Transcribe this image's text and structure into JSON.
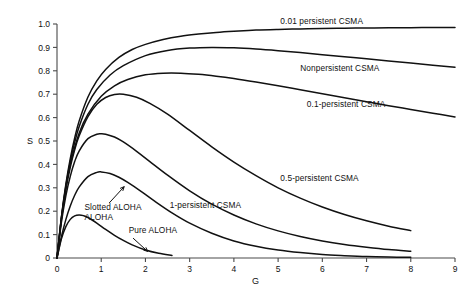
{
  "chart_data": {
    "type": "line",
    "title": "",
    "xlabel": "G",
    "ylabel": "S",
    "xlim": [
      0,
      9
    ],
    "ylim": [
      0,
      1.0
    ],
    "grid": false,
    "legend_position": "inline-annotations",
    "xticks": [
      "0",
      "1",
      "2",
      "3",
      "4",
      "5",
      "6",
      "7",
      "8",
      "9"
    ],
    "yticks": [
      "0",
      "0.1",
      "0.2",
      "0.3",
      "0.4",
      "0.5",
      "0.6",
      "0.7",
      "0.8",
      "0.9",
      "1.0"
    ],
    "series": [
      {
        "name": "0.01 persistent CSMA",
        "label": "0.01 persistent CSMA",
        "label_x": 5.05,
        "label_y": 1.0,
        "peak_value": 0.985,
        "x": [
          0,
          0.1,
          0.2,
          0.3,
          0.4,
          0.5,
          0.7,
          0.9,
          1.1,
          1.4,
          1.7,
          2.0,
          2.4,
          2.8,
          3.2,
          3.6,
          4.0,
          4.5,
          5.0,
          5.5,
          6.0,
          6.5,
          7.0,
          7.5,
          8.0,
          8.5,
          9.0
        ],
        "y": [
          0,
          0.175,
          0.315,
          0.425,
          0.513,
          0.585,
          0.688,
          0.757,
          0.806,
          0.857,
          0.891,
          0.913,
          0.934,
          0.948,
          0.957,
          0.964,
          0.969,
          0.974,
          0.977,
          0.979,
          0.981,
          0.982,
          0.983,
          0.984,
          0.984,
          0.985,
          0.985
        ]
      },
      {
        "name": "Nonpersistent CSMA",
        "label": "Nonpersistent CSMA",
        "label_x": 5.5,
        "label_y": 0.8,
        "peak_value": 0.9,
        "x": [
          0,
          0.1,
          0.2,
          0.3,
          0.4,
          0.5,
          0.7,
          0.9,
          1.2,
          1.5,
          2.0,
          2.5,
          3.0,
          3.5,
          4.0,
          4.5,
          5.0,
          5.5,
          6.0,
          6.5,
          7.0,
          7.5,
          8.0,
          8.5,
          9.0
        ],
        "y": [
          0,
          0.173,
          0.307,
          0.412,
          0.494,
          0.561,
          0.657,
          0.72,
          0.782,
          0.822,
          0.865,
          0.887,
          0.897,
          0.9,
          0.898,
          0.893,
          0.886,
          0.878,
          0.869,
          0.86,
          0.851,
          0.842,
          0.833,
          0.824,
          0.815
        ]
      },
      {
        "name": "0.1-persistent CSMA",
        "label": "0.1-persistent CSMA",
        "label_x": 5.65,
        "label_y": 0.645,
        "peak_value": 0.79,
        "x": [
          0,
          0.1,
          0.2,
          0.3,
          0.5,
          0.7,
          1.0,
          1.3,
          1.6,
          2.0,
          2.4,
          2.8,
          3.2,
          3.6,
          4.0,
          4.5,
          5.0,
          5.5,
          6.0,
          6.5,
          7.0,
          7.5,
          8.0,
          8.5,
          9.0
        ],
        "y": [
          0,
          0.17,
          0.3,
          0.4,
          0.533,
          0.615,
          0.691,
          0.736,
          0.763,
          0.783,
          0.79,
          0.79,
          0.785,
          0.777,
          0.767,
          0.752,
          0.736,
          0.719,
          0.702,
          0.685,
          0.668,
          0.651,
          0.635,
          0.619,
          0.603
        ]
      },
      {
        "name": "0.5-persistent CSMA",
        "label": "0.5-persistent CSMA",
        "label_x": 5.05,
        "label_y": 0.33,
        "peak_value": 0.7,
        "x": [
          0,
          0.1,
          0.2,
          0.3,
          0.4,
          0.5,
          0.7,
          0.9,
          1.1,
          1.3,
          1.5,
          1.8,
          2.1,
          2.5,
          3.0,
          3.5,
          4.0,
          4.5,
          5.0,
          5.5,
          6.0,
          6.5,
          7.0,
          7.5,
          8.0
        ],
        "y": [
          0,
          0.165,
          0.291,
          0.387,
          0.462,
          0.521,
          0.604,
          0.657,
          0.686,
          0.699,
          0.7,
          0.687,
          0.661,
          0.615,
          0.545,
          0.475,
          0.41,
          0.352,
          0.3,
          0.256,
          0.218,
          0.186,
          0.159,
          0.136,
          0.117
        ]
      },
      {
        "name": "1-persistent CSMA",
        "label": "1-persistent CSMA",
        "label_x": 2.55,
        "label_y": 0.215,
        "peak_value": 0.53,
        "x": [
          0,
          0.1,
          0.2,
          0.3,
          0.4,
          0.5,
          0.7,
          0.9,
          1.0,
          1.1,
          1.3,
          1.5,
          1.8,
          2.1,
          2.5,
          3.0,
          3.5,
          4.0,
          4.5,
          5.0,
          5.5,
          6.0,
          6.5,
          7.0,
          7.5,
          8.0
        ],
        "y": [
          0,
          0.153,
          0.266,
          0.349,
          0.412,
          0.457,
          0.51,
          0.529,
          0.531,
          0.529,
          0.517,
          0.496,
          0.456,
          0.412,
          0.354,
          0.287,
          0.23,
          0.184,
          0.146,
          0.116,
          0.092,
          0.073,
          0.058,
          0.046,
          0.036,
          0.029
        ]
      },
      {
        "name": "Slotted ALOHA",
        "label": "Slotted ALOHA",
        "label_x": 0.62,
        "label_y": 0.205,
        "label_line2": "ALOHA",
        "peak_value": 0.368,
        "arrow_from_x": 1.18,
        "arrow_from_y": 0.235,
        "arrow_to_x": 1.52,
        "arrow_to_y": 0.305,
        "x": [
          0,
          0.1,
          0.2,
          0.3,
          0.4,
          0.5,
          0.7,
          0.9,
          1.0,
          1.2,
          1.4,
          1.6,
          1.9,
          2.2,
          2.6,
          3.0,
          3.5,
          4.0,
          4.5,
          5.0,
          5.5,
          6.0,
          6.5,
          7.0,
          7.5,
          8.0
        ],
        "y": [
          0,
          0.091,
          0.164,
          0.222,
          0.268,
          0.303,
          0.348,
          0.366,
          0.368,
          0.361,
          0.345,
          0.323,
          0.285,
          0.244,
          0.193,
          0.149,
          0.106,
          0.073,
          0.05,
          0.034,
          0.023,
          0.015,
          0.01,
          0.006,
          0.004,
          0.003
        ]
      },
      {
        "name": "Pure ALOHA",
        "label": "Pure ALOHA",
        "label_x": 1.62,
        "label_y": 0.105,
        "peak_value": 0.184,
        "arrow_from_x": 1.72,
        "arrow_from_y": 0.085,
        "arrow_to_x": 2.05,
        "arrow_to_y": 0.028,
        "x": [
          0,
          0.1,
          0.2,
          0.3,
          0.4,
          0.5,
          0.6,
          0.7,
          0.9,
          1.1,
          1.3,
          1.5,
          1.7,
          2.0,
          2.3,
          2.6
        ],
        "y": [
          0,
          0.082,
          0.134,
          0.165,
          0.18,
          0.184,
          0.181,
          0.173,
          0.149,
          0.122,
          0.097,
          0.075,
          0.056,
          0.034,
          0.02,
          0.011
        ]
      }
    ]
  },
  "axes": {
    "y_axis_name": "S",
    "x_axis_name": "G"
  }
}
